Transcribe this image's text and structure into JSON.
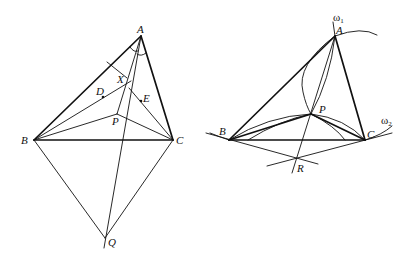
{
  "figures": [
    {
      "id": "left",
      "points": {
        "A": {
          "label": "A",
          "x": 141,
          "y": 36
        },
        "B": {
          "label": "B",
          "x": 34,
          "y": 140
        },
        "C": {
          "label": "C",
          "x": 173,
          "y": 140
        },
        "P": {
          "label": "P",
          "x": 117,
          "y": 114
        },
        "Q": {
          "label": "Q",
          "x": 105,
          "y": 238
        },
        "X": {
          "label": "X",
          "x": 127,
          "y": 83
        },
        "D": {
          "label": "D",
          "x": 103,
          "y": 97
        },
        "E": {
          "label": "E",
          "x": 141,
          "y": 101
        }
      }
    },
    {
      "id": "right",
      "points": {
        "A": {
          "label": "A",
          "x": 335,
          "y": 36
        },
        "B": {
          "label": "B",
          "x": 229,
          "y": 140
        },
        "C": {
          "label": "C",
          "x": 365,
          "y": 140
        },
        "P": {
          "label": "P",
          "x": 311,
          "y": 114
        },
        "R": {
          "label": "R",
          "x": 297,
          "y": 159
        }
      },
      "circles": {
        "omega1": {
          "label": "ω",
          "subscript": "1"
        },
        "omega2": {
          "label": "ω",
          "subscript": "2"
        }
      }
    }
  ]
}
